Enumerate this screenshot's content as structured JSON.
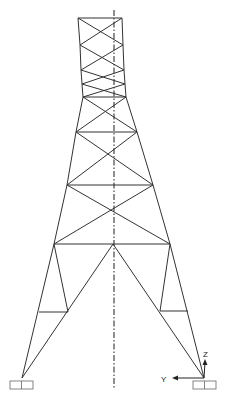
{
  "diagram": {
    "stroke_color": "#333333",
    "background": "#ffffff",
    "axes": {
      "origin": [
        204,
        378
      ],
      "z_label": "Z",
      "y_label": "Y"
    },
    "nodes": {
      "top_left": [
        78,
        18
      ],
      "top_right": [
        122,
        18
      ],
      "j1_left": [
        80,
        45
      ],
      "j1_right": [
        123,
        45
      ],
      "j2_left": [
        81,
        70
      ],
      "j2_right": [
        124,
        70
      ],
      "j3_left": [
        82,
        84
      ],
      "j3_right": [
        125,
        84
      ],
      "j4_left": [
        83,
        97
      ],
      "j4_right": [
        126,
        97
      ],
      "j5_left": [
        76,
        132
      ],
      "j5_right": [
        137,
        132
      ],
      "j6_left": [
        67,
        185
      ],
      "j6_right": [
        153,
        185
      ],
      "j7_left": [
        54,
        244
      ],
      "j7_right": [
        170,
        244
      ],
      "apex": [
        113,
        244
      ],
      "sub_left_inner": [
        68,
        312
      ],
      "sub_left_outer": [
        39,
        312
      ],
      "sub_right_inner": [
        160,
        311
      ],
      "sub_right_outer": [
        188,
        311
      ],
      "base_left": [
        22,
        378
      ],
      "base_right": [
        204,
        378
      ]
    },
    "supports": [
      {
        "name": "left-support",
        "x": 10,
        "y": 381,
        "w": 23,
        "h": 8
      },
      {
        "name": "right-support",
        "x": 193,
        "y": 381,
        "w": 23,
        "h": 8
      }
    ],
    "centerline": {
      "x": 114,
      "y1": 10,
      "y2": 388
    }
  }
}
